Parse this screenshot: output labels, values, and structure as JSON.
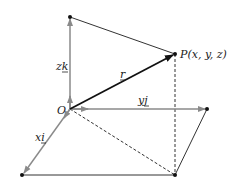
{
  "diagram": {
    "labels": {
      "origin": "O",
      "point": "P(x, y, z)",
      "r": "r",
      "zk": "zk",
      "yj": "yj",
      "xi": "xi"
    },
    "colors": {
      "axis": "#8a8a8a",
      "line": "#333333",
      "r": "#111111"
    }
  }
}
